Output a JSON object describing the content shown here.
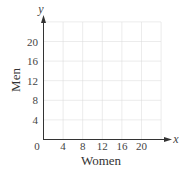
{
  "chart_data": {
    "type": "scatter",
    "title": "",
    "xlabel": "Women",
    "ylabel": "Men",
    "x_axis_symbol": "x",
    "y_axis_symbol": "y",
    "xlim": [
      0,
      24
    ],
    "ylim": [
      0,
      24
    ],
    "x_ticks": [
      4,
      8,
      12,
      16,
      20
    ],
    "y_ticks": [
      4,
      8,
      12,
      16,
      20
    ],
    "origin_label": "0",
    "grid": true,
    "grid_step": 4,
    "series": []
  },
  "colors": {
    "grid": "#d8d8d8",
    "axis": "#333333",
    "text": "#444444"
  }
}
